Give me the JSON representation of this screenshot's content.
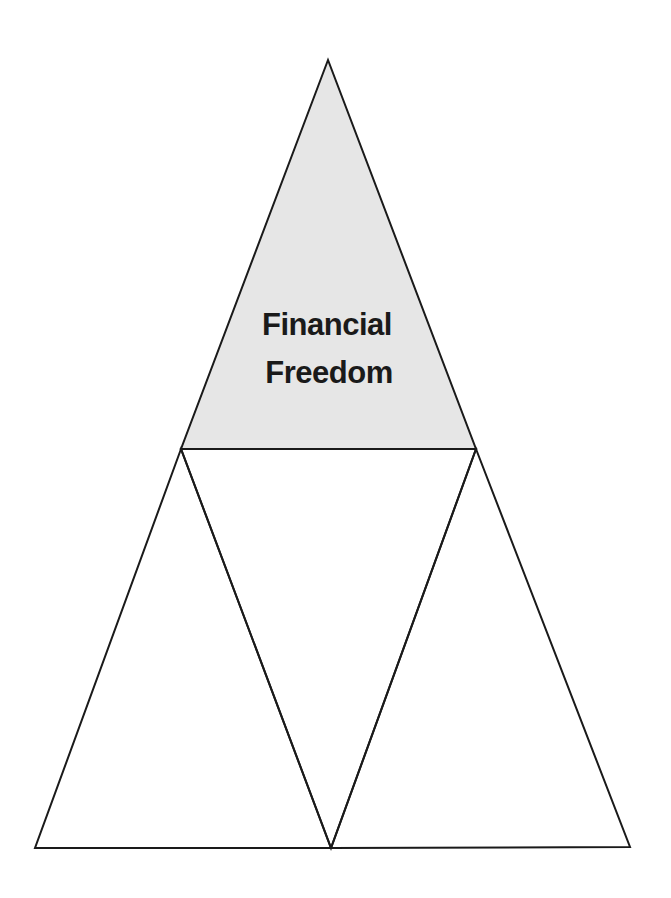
{
  "diagram": {
    "type": "triangle-pyramid",
    "colors": {
      "stroke": "#1a1a1a",
      "top_fill": "#e6e6e6",
      "other_fill": "#ffffff",
      "background": "#ffffff"
    },
    "triangles": [
      {
        "id": "top",
        "label_lines": [
          "Financial",
          "Freedom"
        ],
        "shaded": true
      },
      {
        "id": "bottom-left",
        "label_lines": [],
        "shaded": false
      },
      {
        "id": "center-inverted",
        "label_lines": [],
        "shaded": false
      },
      {
        "id": "bottom-right",
        "label_lines": [],
        "shaded": false
      }
    ]
  }
}
